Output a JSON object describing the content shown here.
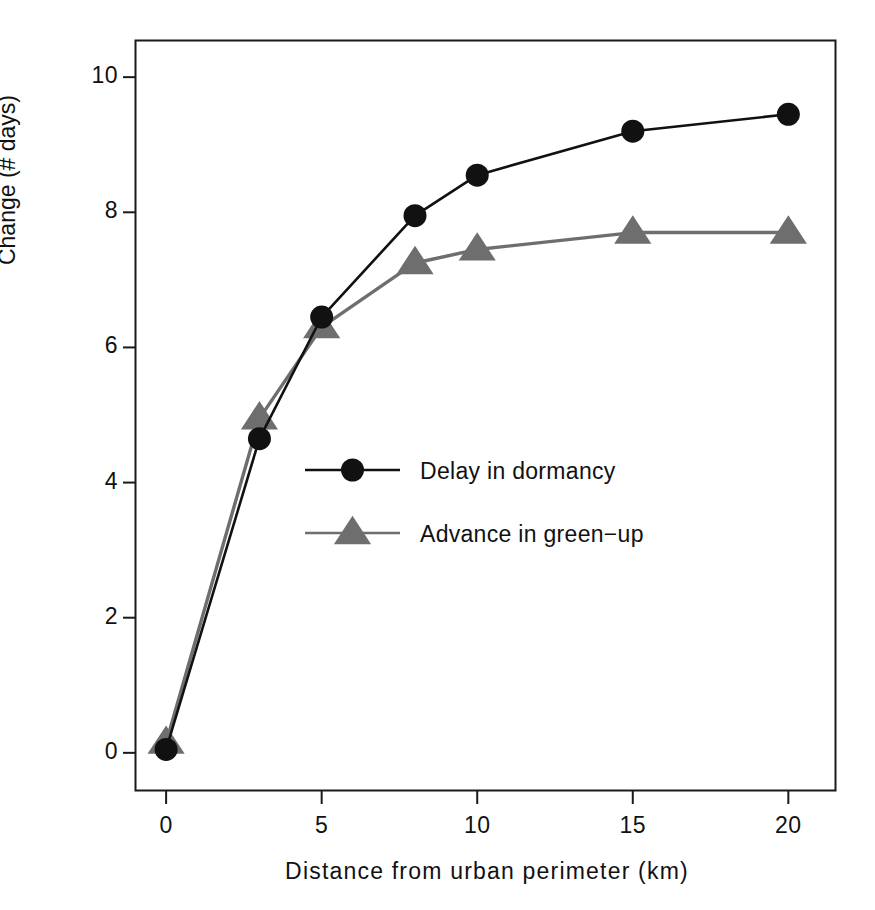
{
  "chart_data": {
    "type": "line",
    "title": "",
    "xlabel": "Distance from  urban  perimeter  (km)",
    "ylabel": "Change (# days)",
    "xlim": [
      -1.0,
      21.5
    ],
    "ylim": [
      -0.55,
      10.55
    ],
    "xticks": [
      0,
      5,
      10,
      15,
      20
    ],
    "xtick_labels": [
      "0",
      "5",
      "10",
      "15",
      "20"
    ],
    "yticks": [
      0,
      2,
      4,
      6,
      8,
      10
    ],
    "ytick_labels": [
      "0",
      "2",
      "4",
      "6",
      "8",
      "10"
    ],
    "grid": false,
    "legend_position": "center",
    "x": [
      0,
      3,
      5,
      8,
      10,
      15,
      20
    ],
    "series": [
      {
        "name": "Delay in dormancy",
        "marker": "circle",
        "color": "#111111",
        "values": [
          0.05,
          4.65,
          6.45,
          7.95,
          8.55,
          9.2,
          9.45
        ]
      },
      {
        "name": "Advance in green-up",
        "marker": "triangle",
        "color": "#6e6e6e",
        "values": [
          0.15,
          4.95,
          6.3,
          7.25,
          7.45,
          7.7,
          7.7
        ]
      }
    ],
    "legend_entries": [
      {
        "label": "Delay in dormancy",
        "marker": "circle",
        "color": "#111111"
      },
      {
        "label": "Advance in green−up",
        "marker": "triangle",
        "color": "#6e6e6e"
      }
    ]
  },
  "axes": {
    "y_tick_0": "0",
    "y_tick_2": "2",
    "y_tick_4": "4",
    "y_tick_6": "6",
    "y_tick_8": "8",
    "y_tick_10": "10",
    "x_tick_0": "0",
    "x_tick_5": "5",
    "x_tick_10": "10",
    "x_tick_15": "15",
    "x_tick_20": "20",
    "x_axis_title": "Distance from  urban  perimeter  (km)",
    "y_axis_title": "Change (# days)"
  },
  "legend": {
    "entry_1_label": "Delay in dormancy",
    "entry_2_label": "Advance in green−up"
  },
  "colors": {
    "series_1": "#111111",
    "series_2": "#6e6e6e",
    "axis": "#1a1a1a",
    "background": "#ffffff"
  }
}
